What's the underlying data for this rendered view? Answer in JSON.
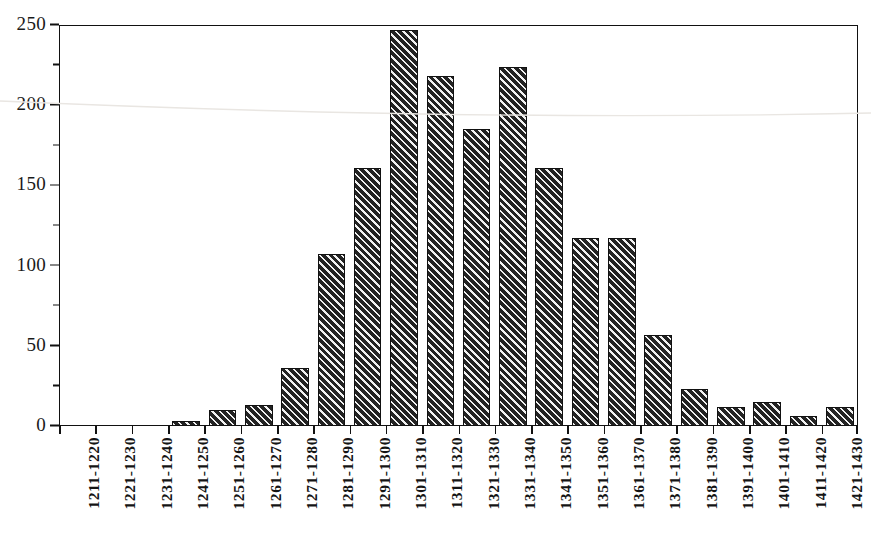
{
  "chart_data": {
    "type": "bar",
    "title": "",
    "subtitle": "",
    "xlabel": "",
    "ylabel": "",
    "ylim": [
      0,
      250
    ],
    "y_major_ticks": [
      0,
      50,
      100,
      150,
      200,
      250
    ],
    "y_minor_ticks": [
      25,
      75,
      125,
      175,
      225
    ],
    "y_tick_labels": [
      "0",
      "50",
      "100",
      "150",
      "200",
      "250"
    ],
    "grid": false,
    "legend": null,
    "legend_position": "none",
    "bar_fill": "diagonal-hatch",
    "bar_color": "#232323",
    "frame_color": "#111111",
    "categories": [
      "1211-1220",
      "1221-1230",
      "1231-1240",
      "1241-1250",
      "1251-1260",
      "1261-1270",
      "1271-1280",
      "1281-1290",
      "1291-1300",
      "1301-1310",
      "1311-1320",
      "1321-1330",
      "1331-1340",
      "1341-1350",
      "1351-1360",
      "1361-1370",
      "1371-1380",
      "1381-1390",
      "1391-1400",
      "1401-1410",
      "1411-1420",
      "1421-1430"
    ],
    "values": [
      0,
      0,
      0,
      3,
      10,
      13,
      36,
      107,
      161,
      247,
      218,
      185,
      224,
      161,
      117,
      117,
      57,
      23,
      12,
      15,
      6,
      12
    ]
  }
}
